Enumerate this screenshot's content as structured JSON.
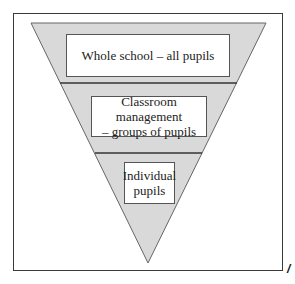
{
  "diagram": {
    "type": "inverted-funnel",
    "colors": {
      "fill": "#d9d9d9",
      "stroke": "#555555",
      "frame": "#3a3a3a",
      "box_fill": "#ffffff"
    },
    "levels": [
      {
        "id": "whole-school",
        "label": "Whole school – all pupils",
        "lines": [
          "Whole school – all pupils"
        ]
      },
      {
        "id": "classroom-management",
        "label": "Classroom management – groups of pupils",
        "lines": [
          "Classroom management",
          "– groups of pupils"
        ]
      },
      {
        "id": "individual",
        "label": "Individual pupils",
        "lines": [
          "Individual",
          "pupils"
        ]
      }
    ],
    "corner_mark": "/"
  }
}
